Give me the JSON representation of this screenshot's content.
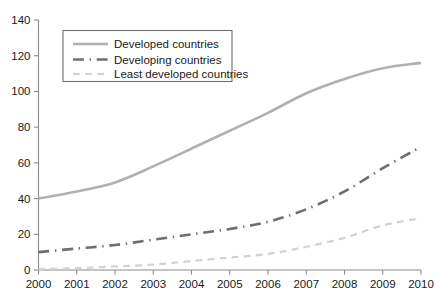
{
  "chart_data": {
    "type": "line",
    "title": "",
    "subtitle": "",
    "xlabel": "",
    "ylabel": "",
    "x": [
      2000,
      2001,
      2002,
      2003,
      2004,
      2005,
      2006,
      2007,
      2008,
      2009,
      2010
    ],
    "categories": [
      "2000",
      "2001",
      "2002",
      "2003",
      "2004",
      "2005",
      "2006",
      "2007",
      "2008",
      "2009",
      "2010"
    ],
    "xlim": [
      2000,
      2010
    ],
    "ylim": [
      0,
      140
    ],
    "yticks": [
      0,
      20,
      40,
      60,
      80,
      100,
      120,
      140
    ],
    "ytick_labels": [
      "0",
      "20",
      "40",
      "60",
      "80",
      "100",
      "120",
      "140"
    ],
    "xtick_labels": [
      "2000",
      "2001",
      "2002",
      "2003",
      "2004",
      "2005",
      "2006",
      "2007",
      "2008",
      "2009",
      "2010"
    ],
    "grid": false,
    "legend_position": "upper-left-inside",
    "series": [
      {
        "name": "Developed countries",
        "values": [
          40,
          44,
          49,
          58,
          68,
          78,
          88,
          99,
          107,
          113,
          116
        ],
        "color": "#b0b0b0",
        "style": "solid",
        "width": 2.6
      },
      {
        "name": "Developing countries",
        "values": [
          10,
          12,
          14,
          17,
          20,
          23,
          27,
          34,
          44,
          57,
          69
        ],
        "color": "#6e6e6e",
        "style": "dash-dot",
        "width": 2.6
      },
      {
        "name": "Least developed countries",
        "values": [
          0.5,
          1,
          2,
          3,
          5,
          7,
          9,
          13,
          18,
          25,
          29
        ],
        "color": "#d2d2d2",
        "style": "dashed",
        "width": 2.2
      }
    ]
  },
  "legend": {
    "entries": [
      {
        "label": "Developed countries"
      },
      {
        "label": "Developing countries"
      },
      {
        "label": "Least developed countries"
      }
    ]
  },
  "axes": {
    "axis_color": "#8a8a8a",
    "tick_label_color": "#1a1a1a"
  }
}
